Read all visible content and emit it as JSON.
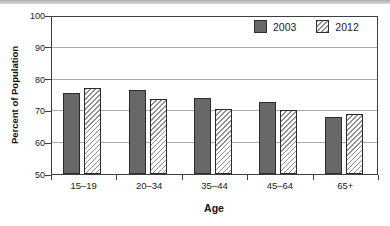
{
  "chart_data": {
    "type": "bar",
    "title": "",
    "xlabel": "Age",
    "ylabel": "Percent of Population",
    "ylim": [
      50,
      100
    ],
    "yticks": [
      50,
      60,
      70,
      80,
      90,
      100
    ],
    "categories": [
      "15–19",
      "20–34",
      "35–44",
      "45–64",
      "65+"
    ],
    "series": [
      {
        "name": "2003",
        "style": "solid",
        "values": [
          75.5,
          76.5,
          74.0,
          72.5,
          68.0
        ]
      },
      {
        "name": "2012",
        "style": "hatched",
        "values": [
          77.0,
          73.5,
          70.5,
          70.0,
          69.0
        ]
      }
    ],
    "legend_position": "top-right",
    "grid": "horizontal"
  },
  "colors": {
    "bar_2003_fill": "#686868",
    "bar_border": "#2b2b2b",
    "hatch_line": "#8f8f8f",
    "hatch_bg": "#ffffff",
    "gridline": "#ababab",
    "axis": "#3f3f3f",
    "text": "#1a1a1a",
    "top_band": "#aeaeae"
  }
}
